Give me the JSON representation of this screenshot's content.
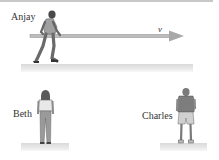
{
  "scene": {
    "figures": [
      {
        "id": "anjay",
        "label": "Anjay",
        "pose": "running-with-pole"
      },
      {
        "id": "beth",
        "label": "Beth",
        "pose": "standing-back-view"
      },
      {
        "id": "charles",
        "label": "Charles",
        "pose": "standing-back-view"
      }
    ],
    "velocity_arrow": {
      "label": "v",
      "direction": "right"
    }
  },
  "colors": {
    "ground": "#dcdcdc",
    "arrow": "#a8a8a8",
    "figure": "#7a7a7a",
    "text": "#333333"
  }
}
